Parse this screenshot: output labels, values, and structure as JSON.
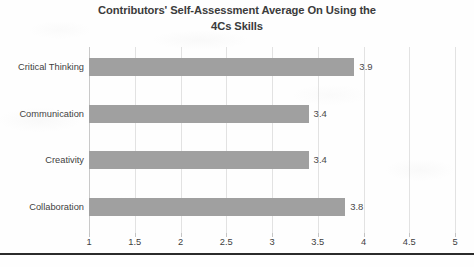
{
  "chart_data": {
    "type": "bar",
    "orientation": "horizontal",
    "title": "Contributors' Self-Assessment Average On Using the 4Cs Skills",
    "title_line1": "Contributors' Self-Assessment Average On Using the",
    "title_line2": "4Cs Skills",
    "categories": [
      "Critical Thinking",
      "Communication",
      "Creativity",
      "Collaboration"
    ],
    "values": [
      3.9,
      3.4,
      3.4,
      3.8
    ],
    "value_labels": [
      "3.9",
      "3.4",
      "3.4",
      "3.8"
    ],
    "xlabel": "",
    "ylabel": "",
    "xlim": [
      1,
      5
    ],
    "xticks": [
      1,
      1.5,
      2,
      2.5,
      3,
      3.5,
      4,
      4.5,
      5
    ],
    "xtick_labels": [
      "1",
      "1.5",
      "2",
      "2.5",
      "3",
      "3.5",
      "4",
      "4.5",
      "5"
    ],
    "grid": true,
    "grid_axis": "x",
    "legend": false,
    "bar_color": "#a0a0a0",
    "grid_color": "#e2e2e2",
    "title_color": "#3b3b3b",
    "label_color": "#3f3f3f"
  }
}
